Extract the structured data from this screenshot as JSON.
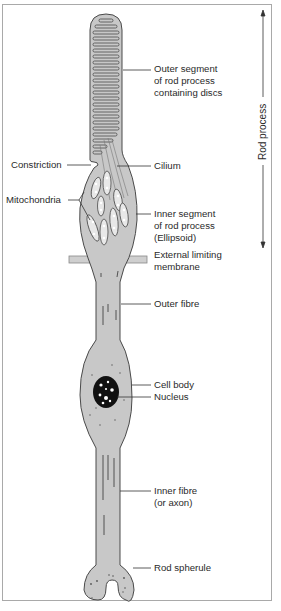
{
  "diagram": {
    "colors": {
      "cell_fill": "#c8c8c8",
      "outline": "#4a4a4a",
      "nucleus": "#111111",
      "frame": "#a9a9a9",
      "text": "#2a2a2a"
    },
    "labels": {
      "outer_segment": [
        "Outer segment",
        "of rod process",
        "containing discs"
      ],
      "constriction": "Constriction",
      "cilium": "Cilium",
      "mitochondria": "Mitochondria",
      "inner_segment": [
        "Inner segment",
        "of rod process",
        "(Ellipsoid)"
      ],
      "external_limiting_membrane": [
        "External limiting",
        "membrane"
      ],
      "outer_fibre": "Outer fibre",
      "cell_body": "Cell body",
      "nucleus": "Nucleus",
      "inner_fibre": [
        "Inner fibre",
        "(or axon)"
      ],
      "rod_spherule": "Rod spherule",
      "rod_process": "Rod process"
    }
  }
}
